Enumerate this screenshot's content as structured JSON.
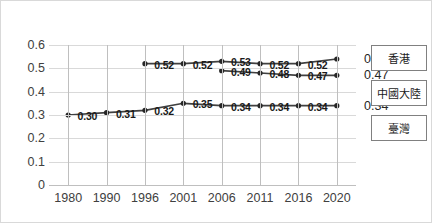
{
  "chart_data": {
    "type": "line",
    "title": "",
    "xlabel": "",
    "ylabel": "",
    "categories": [
      "1980",
      "1990",
      "1996",
      "2001",
      "2006",
      "2011",
      "2016",
      "2020"
    ],
    "ylim": [
      0,
      0.6
    ],
    "yticks": [
      "0",
      "0.1",
      "0.2",
      "0.3",
      "0.4",
      "0.5",
      "0.6"
    ],
    "grid": true,
    "legend_position": "right",
    "series": [
      {
        "name": "香港",
        "color": "#404040",
        "x": [
          "1996",
          "2001",
          "2006",
          "2011",
          "2016",
          "2020"
        ],
        "values": [
          0.52,
          0.52,
          0.53,
          0.52,
          0.52,
          0.54
        ],
        "labels": [
          "0.52",
          "0.52",
          "0.53",
          "0.52",
          "0.52",
          "0.54"
        ],
        "end_label": "0.54"
      },
      {
        "name": "中國大陸",
        "color": "#404040",
        "x": [
          "2006",
          "2011",
          "2016",
          "2020"
        ],
        "values": [
          0.49,
          0.48,
          0.47,
          0.47
        ],
        "labels": [
          "0.49",
          "0.48",
          "0.47",
          "0.47"
        ],
        "end_label": "0.47"
      },
      {
        "name": "臺灣",
        "color": "#404040",
        "x": [
          "1980",
          "1990",
          "1996",
          "2001",
          "2006",
          "2011",
          "2016",
          "2020"
        ],
        "values": [
          0.3,
          0.31,
          0.32,
          0.35,
          0.34,
          0.34,
          0.34,
          0.34
        ],
        "labels": [
          "0.30",
          "0.31",
          "0.32",
          "0.35",
          "0.34",
          "0.34",
          "0.34",
          "0.34"
        ],
        "end_label": "0.34"
      }
    ]
  },
  "legend": {
    "items": [
      {
        "label": "香港"
      },
      {
        "label": "中國大陸"
      },
      {
        "label": "臺灣"
      }
    ]
  }
}
